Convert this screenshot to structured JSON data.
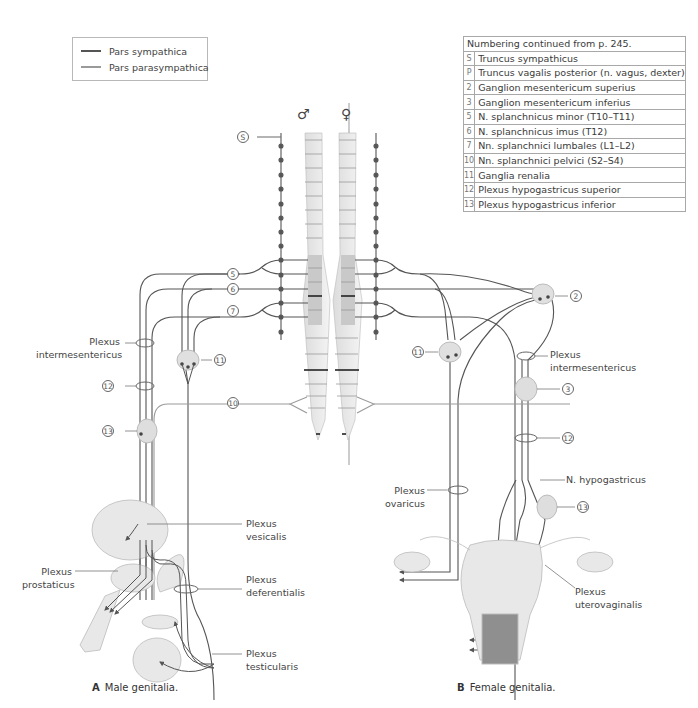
{
  "legend": {
    "items": [
      {
        "label": "Pars sympathica",
        "color": "#555555"
      },
      {
        "label": "Pars parasympathica",
        "color": "#9a9a9a"
      }
    ]
  },
  "numbering_table": {
    "header": "Numbering continued from p. 245.",
    "rows": [
      {
        "num": "S",
        "label": "Truncus sympathicus"
      },
      {
        "num": "P",
        "label": "Truncus vagalis posterior (n. vagus, dexter)"
      },
      {
        "num": "2",
        "label": "Ganglion mesentericum superius"
      },
      {
        "num": "3",
        "label": "Ganglion mesentericum inferius"
      },
      {
        "num": "5",
        "label": "N. splanchnicus minor (T10–T11)"
      },
      {
        "num": "6",
        "label": "N. splanchnicus imus (T12)"
      },
      {
        "num": "7",
        "label": "Nn. splanchnici lumbales (L1–L2)"
      },
      {
        "num": "10",
        "label": "Nn. splanchnici pelvici (S2–S4)"
      },
      {
        "num": "11",
        "label": "Ganglia renalia"
      },
      {
        "num": "12",
        "label": "Plexus hypogastricus superior"
      },
      {
        "num": "13",
        "label": "Plexus hypogastricus inferior"
      }
    ]
  },
  "symbols": {
    "male": "♂",
    "female": "♀"
  },
  "male": {
    "caption_letter": "A",
    "caption_text": "Male genitalia.",
    "markers": {
      "s": "S",
      "n5": "5",
      "n6": "6",
      "n7": "7",
      "n10": "10",
      "n11": "11",
      "n12": "12",
      "n13": "13"
    },
    "labels": {
      "plexus_intermesentericus": [
        "Plexus",
        "intermesentericus"
      ],
      "plexus_vesicalis": [
        "Plexus",
        "vesicalis"
      ],
      "plexus_prostaticus": [
        "Plexus",
        "prostaticus"
      ],
      "plexus_deferentialis": [
        "Plexus",
        "deferentialis"
      ],
      "plexus_testicularis": [
        "Plexus",
        "testicularis"
      ]
    }
  },
  "female": {
    "caption_letter": "B",
    "caption_text": "Female genitalia.",
    "markers": {
      "n2": "2",
      "n3": "3",
      "n11": "11",
      "n12": "12",
      "n13": "13"
    },
    "labels": {
      "plexus_intermesentericus": [
        "Plexus",
        "intermesentericus"
      ],
      "n_hypogastricus": "N. hypogastricus",
      "plexus_ovaricus": [
        "Plexus",
        "ovaricus"
      ],
      "plexus_uterovaginalis": [
        "Plexus",
        "uterovaginalis"
      ]
    }
  },
  "colors": {
    "sympathetic": "#555555",
    "parasympathetic": "#9a9a9a",
    "organ_fill": "#e6e6e6",
    "spine_dark": "#c8c8c8",
    "spine_light": "#ececec",
    "vagina_fill": "#8f8f8f"
  }
}
